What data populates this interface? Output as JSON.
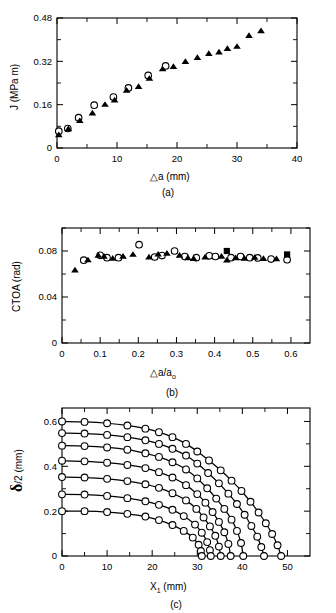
{
  "figure": {
    "panels": [
      "a",
      "b",
      "c"
    ]
  },
  "panel_a": {
    "caption": "(a)",
    "ylabel": "J (MPa m)",
    "xlabel_delta": "△",
    "xlabel": "a  (mm)",
    "ytick_labels": [
      "0",
      "0.16",
      "0.32",
      "0.48"
    ],
    "xtick_labels": [
      "0",
      "10",
      "20",
      "30",
      "40"
    ]
  },
  "panel_b": {
    "caption": "(b)",
    "ylabel": "CTOA (rad)",
    "xlabel_delta": "△",
    "xlabel": "a/a",
    "xlabel_sub": "o",
    "ytick_labels": [
      "0",
      "0.04",
      "0.08"
    ],
    "xtick_labels": [
      "0",
      "0.1",
      "0.2",
      "0.3",
      "0.4",
      "0.5",
      "0.6"
    ]
  },
  "panel_c": {
    "caption": "(c)",
    "ylabel_sym": "δ",
    "ylabel": "/2  (mm)",
    "xlabel_sym": "X",
    "xlabel_sub": "1",
    "xlabel": " (mm)",
    "ytick_labels": [
      "0",
      "0.2",
      "0.4",
      "0.6"
    ],
    "xtick_labels": [
      "0",
      "10",
      "20",
      "30",
      "40",
      "50"
    ]
  },
  "chart_data": [
    {
      "type": "scatter",
      "panel": "a",
      "title": "",
      "xlabel": "Δa (mm)",
      "ylabel": "J (MPa m)",
      "xlim": [
        0,
        40
      ],
      "ylim": [
        0,
        0.48
      ],
      "xticks": [
        0,
        10,
        20,
        30,
        40
      ],
      "yticks": [
        0,
        0.16,
        0.32,
        0.48
      ],
      "grid": false,
      "legend": "none",
      "series": [
        {
          "name": "open-circle",
          "marker": "circle-open",
          "x": [
            0.3,
            1.8,
            3.6,
            6.2,
            9.4,
            11.9,
            15.2,
            18.1
          ],
          "y": [
            0.062,
            0.072,
            0.112,
            0.158,
            0.188,
            0.222,
            0.268,
            0.303
          ]
        },
        {
          "name": "filled-triangle",
          "marker": "triangle-filled",
          "x": [
            0.3,
            1.9,
            3.8,
            5.9,
            8.0,
            9.6,
            11.6,
            13.6,
            15.4,
            17.6,
            19.4,
            21.4,
            23.4,
            25.3,
            27.0,
            28.4,
            30.0,
            32.0,
            34.0
          ],
          "y": [
            0.048,
            0.07,
            0.1,
            0.128,
            0.16,
            0.176,
            0.212,
            0.226,
            0.256,
            0.291,
            0.3,
            0.318,
            0.333,
            0.348,
            0.353,
            0.366,
            0.374,
            0.414,
            0.432
          ]
        }
      ]
    },
    {
      "type": "scatter",
      "panel": "b",
      "title": "",
      "xlabel": "Δa/a_o",
      "ylabel": "CTOA (rad)",
      "xlim": [
        0,
        0.65
      ],
      "ylim": [
        0,
        0.1
      ],
      "xticks": [
        0,
        0.1,
        0.2,
        0.3,
        0.4,
        0.5,
        0.6
      ],
      "yticks": [
        0,
        0.04,
        0.08
      ],
      "grid": false,
      "legend": "none",
      "series": [
        {
          "name": "open-circle",
          "marker": "circle-open",
          "x": [
            0.057,
            0.1,
            0.118,
            0.148,
            0.202,
            0.243,
            0.262,
            0.295,
            0.322,
            0.352,
            0.386,
            0.402,
            0.443,
            0.468,
            0.492,
            0.513,
            0.548,
            0.59
          ],
          "y": [
            0.072,
            0.0762,
            0.0742,
            0.0742,
            0.0855,
            0.0748,
            0.076,
            0.08,
            0.0752,
            0.0742,
            0.0758,
            0.0752,
            0.0742,
            0.0752,
            0.0742,
            0.074,
            0.073,
            0.0725
          ]
        },
        {
          "name": "filled-triangle",
          "marker": "triangle-filled",
          "x": [
            0.034,
            0.068,
            0.095,
            0.11,
            0.133,
            0.16,
            0.186,
            0.228,
            0.252,
            0.275,
            0.308,
            0.33,
            0.345,
            0.375,
            0.418,
            0.432,
            0.455,
            0.478,
            0.505,
            0.528,
            0.562
          ],
          "y": [
            0.0632,
            0.072,
            0.076,
            0.0752,
            0.0735,
            0.0752,
            0.0768,
            0.0745,
            0.077,
            0.0778,
            0.076,
            0.0738,
            0.0732,
            0.0745,
            0.0752,
            0.0718,
            0.0738,
            0.0735,
            0.0742,
            0.0732,
            0.073
          ]
        },
        {
          "name": "filled-square",
          "marker": "square-filled",
          "x": [
            0.432,
            0.59
          ],
          "y": [
            0.08,
            0.077
          ]
        }
      ]
    },
    {
      "type": "line",
      "panel": "c",
      "title": "",
      "xlabel": "X_1 (mm)",
      "ylabel": "δ/2 (mm)",
      "xlim": [
        0,
        55
      ],
      "ylim": [
        0,
        0.66
      ],
      "xticks": [
        0,
        10,
        20,
        30,
        40,
        50
      ],
      "yticks": [
        0,
        0.2,
        0.4,
        0.6
      ],
      "grid": false,
      "legend": "none",
      "marker": "circle-open",
      "series": [
        {
          "name": "curve-1",
          "x": [
            0,
            5,
            10,
            14.5,
            18.5,
            21.5,
            24.5,
            27.0,
            29.0,
            30.3,
            30.8,
            31.0
          ],
          "y": [
            0.2,
            0.2,
            0.196,
            0.188,
            0.176,
            0.16,
            0.138,
            0.112,
            0.082,
            0.05,
            0.022,
            0.0
          ]
        },
        {
          "name": "curve-2",
          "x": [
            0,
            5,
            10,
            14.5,
            18.5,
            21.5,
            24.5,
            27.0,
            29.5,
            31.0,
            32.2,
            32.8,
            33.0
          ],
          "y": [
            0.275,
            0.274,
            0.268,
            0.258,
            0.244,
            0.228,
            0.206,
            0.178,
            0.14,
            0.104,
            0.062,
            0.026,
            0.0
          ]
        },
        {
          "name": "curve-3",
          "x": [
            0,
            5,
            10,
            14.5,
            18.5,
            21.5,
            24.5,
            27.5,
            29.8,
            31.4,
            32.8,
            34.0,
            34.8,
            35.2
          ],
          "y": [
            0.352,
            0.35,
            0.344,
            0.334,
            0.32,
            0.304,
            0.28,
            0.248,
            0.21,
            0.172,
            0.132,
            0.09,
            0.042,
            0.0
          ]
        },
        {
          "name": "curve-4",
          "x": [
            0,
            5,
            10,
            14.5,
            18.5,
            21.5,
            24.5,
            27.5,
            30.0,
            31.8,
            33.4,
            34.8,
            36.0,
            36.9,
            37.4
          ],
          "y": [
            0.425,
            0.422,
            0.416,
            0.406,
            0.392,
            0.374,
            0.35,
            0.316,
            0.276,
            0.238,
            0.196,
            0.152,
            0.106,
            0.054,
            0.0
          ]
        },
        {
          "name": "curve-5",
          "x": [
            0,
            5,
            10,
            14.5,
            18.5,
            21.5,
            24.5,
            27.5,
            30.0,
            32.2,
            34.2,
            36.0,
            37.6,
            38.8,
            39.7,
            40.2
          ],
          "y": [
            0.492,
            0.49,
            0.484,
            0.474,
            0.458,
            0.442,
            0.418,
            0.386,
            0.346,
            0.302,
            0.256,
            0.21,
            0.162,
            0.112,
            0.058,
            0.0
          ]
        },
        {
          "name": "curve-6",
          "x": [
            0,
            5,
            10,
            14.5,
            18.5,
            21.5,
            24.5,
            27.5,
            30.0,
            32.4,
            34.8,
            36.9,
            38.8,
            40.5,
            42.0,
            43.3,
            44.2,
            44.8
          ],
          "y": [
            0.548,
            0.546,
            0.54,
            0.53,
            0.516,
            0.5,
            0.478,
            0.448,
            0.412,
            0.37,
            0.324,
            0.278,
            0.232,
            0.184,
            0.134,
            0.086,
            0.04,
            0.0
          ]
        },
        {
          "name": "curve-7",
          "x": [
            0,
            5,
            10,
            14.5,
            18.5,
            21.5,
            24.5,
            27.5,
            30.0,
            32.6,
            35.2,
            37.6,
            39.8,
            41.8,
            43.6,
            45.2,
            46.6,
            47.8,
            48.6
          ],
          "y": [
            0.6,
            0.598,
            0.592,
            0.582,
            0.568,
            0.552,
            0.53,
            0.5,
            0.466,
            0.426,
            0.382,
            0.336,
            0.29,
            0.242,
            0.194,
            0.146,
            0.098,
            0.048,
            0.0
          ]
        }
      ]
    }
  ]
}
